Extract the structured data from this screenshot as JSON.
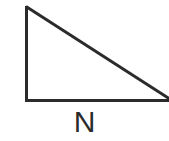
{
  "figure": {
    "name": "right-triangle-diagram",
    "background_color": "#ffffff",
    "stroke_color": "#2b2b2b",
    "stroke_width": 3,
    "canvas": {
      "width": 169,
      "height": 141
    }
  },
  "shape": {
    "type": "right-triangle",
    "vertices": {
      "apex_top_left": {
        "x": 26,
        "y": 6
      },
      "right_angle_bottom_left": {
        "x": 26,
        "y": 100
      },
      "bottom_right_offscreen": {
        "x": 172,
        "y": 100
      }
    },
    "edges": [
      {
        "name": "vertical-leg",
        "from": "apex_top_left",
        "to": "right_angle_bottom_left"
      },
      {
        "name": "horizontal-base",
        "from": "right_angle_bottom_left",
        "to": "bottom_right_offscreen"
      },
      {
        "name": "hypotenuse",
        "from": "apex_top_left",
        "to": "bottom_right_offscreen"
      }
    ]
  },
  "labels": {
    "base_label": "N"
  }
}
